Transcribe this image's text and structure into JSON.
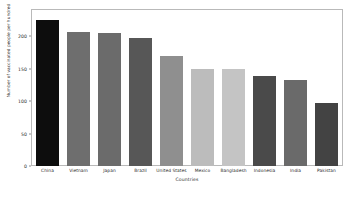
{
  "chart_data": {
    "type": "bar",
    "title": "",
    "xlabel": "Countries",
    "ylabel": "Number of vaccinated people per hundred",
    "categories": [
      "China",
      "Vietnam",
      "Japan",
      "Brazil",
      "United States",
      "Mexico",
      "Bangladesh",
      "Indonesia",
      "India",
      "Pakistan"
    ],
    "values": [
      224,
      206,
      204,
      197,
      169,
      150,
      150,
      138,
      132,
      97
    ],
    "bar_colors": [
      "#0d0d0d",
      "#6e6e6e",
      "#6b6b6b",
      "#575757",
      "#8f8f8f",
      "#bcbcbc",
      "#c4c4c4",
      "#4a4a4a",
      "#6a6a6a",
      "#434343"
    ],
    "ylim": [
      0,
      240
    ],
    "ytick_labels": [
      "0",
      "50",
      "100",
      "150",
      "200"
    ],
    "ytick_values": [
      0,
      50,
      100,
      150,
      200
    ],
    "grid": false,
    "legend": null,
    "axes_color": "#b9b9b9",
    "text_color": "#2b2b2b",
    "background": "#ffffff"
  }
}
